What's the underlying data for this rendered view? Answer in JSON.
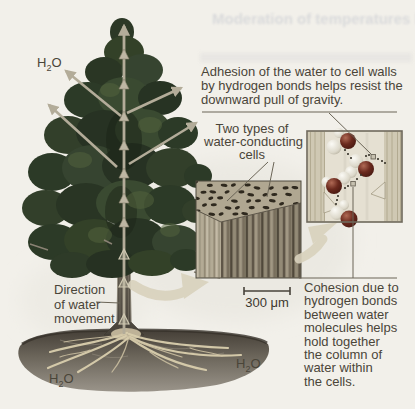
{
  "labels": {
    "h2o": {
      "h": "H",
      "sub": "2",
      "o": "O"
    },
    "adhesion": [
      "Adhesion of the water to cell walls",
      "by hydrogen bonds helps resist the",
      "downward pull of gravity."
    ],
    "two_types": [
      "Two types of",
      "water-conducting",
      "cells"
    ],
    "direction": [
      "Direction",
      "of water",
      "movement"
    ],
    "cohesion": [
      "Cohesion due to",
      "hydrogen bonds",
      "between water",
      "molecules helps",
      "hold together",
      "the column of",
      "water within",
      "the cells."
    ],
    "scale_bar": "300 μm",
    "ghost_heading": "Moderation of temperatures by wat"
  },
  "icons": {
    "water_flow_arrow": "↑",
    "transpiration_arrow": "↗",
    "curved_flow_arrow": "➜",
    "hydrogen_bond_dots": "⋯"
  },
  "colors": {
    "background": "#f2f0ea",
    "foliage": "#2f3b28",
    "trunk": "#55504a",
    "soil": "#48423a",
    "roots": "#d9cead",
    "flow_arrow": "#b3ac99",
    "curved_arrow": "#d9d2bd",
    "oxygen_sphere": "#6b2a1e",
    "hydrogen_sphere": "#e9e6dc",
    "panel_background": "#ded8c9",
    "micrograph_pore": "#241e15",
    "label_text": "#4a4539"
  }
}
